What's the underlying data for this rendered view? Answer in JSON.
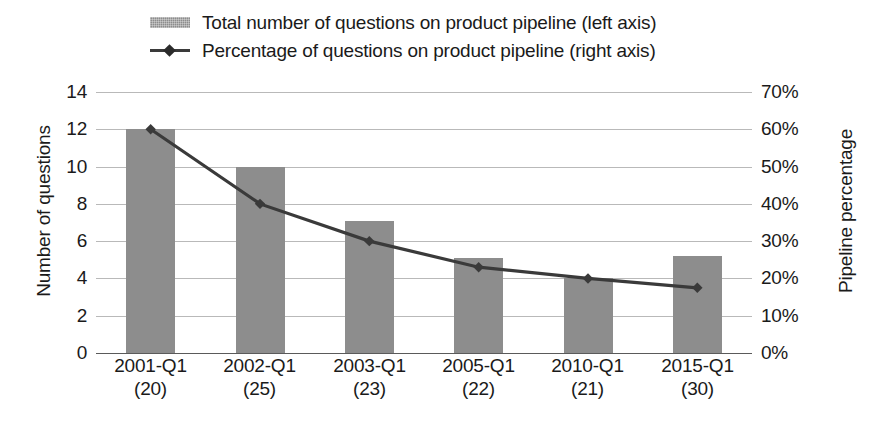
{
  "legend": {
    "items": [
      {
        "label": "Total number of questions on product pipeline (left axis)",
        "marker": "bar-swatch-icon",
        "color": "#8d8d8d"
      },
      {
        "label": "Percentage of questions on product pipeline (right axis)",
        "marker": "line-diamond-icon",
        "color": "#3a3a3a"
      }
    ]
  },
  "axes": {
    "left_title": "Number of questions",
    "right_title": "Pipeline percentage",
    "left_ticks": [
      "0",
      "2",
      "4",
      "6",
      "8",
      "10",
      "12",
      "14"
    ],
    "right_ticks": [
      "0%",
      "10%",
      "20%",
      "30%",
      "40%",
      "50%",
      "60%",
      "70%"
    ]
  },
  "chart_data": {
    "type": "bar",
    "title": "",
    "xlabel": "",
    "ylabel": "Number of questions",
    "y2label": "Pipeline percentage",
    "categories": [
      "2001-Q1",
      "2002-Q1",
      "2003-Q1",
      "2005-Q1",
      "2010-Q1",
      "2015-Q1"
    ],
    "category_sublabels": [
      "(20)",
      "(25)",
      "(23)",
      "(22)",
      "(21)",
      "(30)"
    ],
    "ylim": [
      0,
      14
    ],
    "y2lim": [
      0,
      70
    ],
    "yticks": [
      0,
      2,
      4,
      6,
      8,
      10,
      12,
      14
    ],
    "y2ticks": [
      0,
      10,
      20,
      30,
      40,
      50,
      60,
      70
    ],
    "grid": true,
    "legend_position": "top",
    "series": [
      {
        "name": "Total number of questions on product pipeline (left axis)",
        "type": "bar",
        "axis": "left",
        "color": "#8d8d8d",
        "values": [
          12,
          10,
          7.1,
          5.1,
          4,
          5.2
        ]
      },
      {
        "name": "Percentage of questions on product pipeline (right axis)",
        "type": "line",
        "axis": "right",
        "color": "#3a3a3a",
        "marker": "diamond",
        "values": [
          60,
          40,
          30,
          23,
          20,
          17.5
        ]
      }
    ]
  }
}
